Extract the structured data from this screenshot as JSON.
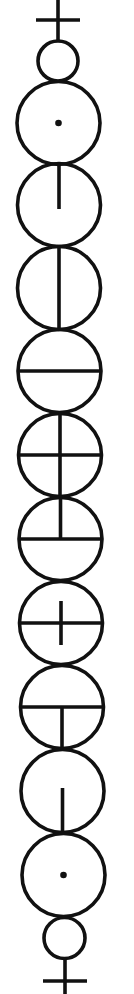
{
  "diagram": {
    "title": "",
    "type": "stacked-circle-symbol-sequence",
    "width": 134,
    "height": 994,
    "colors": {
      "ink": "#111111",
      "background": "#ffffff"
    },
    "stroke_width": 3.6,
    "top_terminal": {
      "cross": {
        "x": 58,
        "y_top": 0,
        "y_bottom": 41,
        "bar_y": 20,
        "bar_x1": 36,
        "bar_x2": 80
      },
      "small_circle": {
        "cx": 58,
        "cy": 61,
        "r": 20
      }
    },
    "circles": [
      {
        "index": 1,
        "cx": 58.5,
        "cy": 123,
        "r": 41.5,
        "mark": "center-dot"
      },
      {
        "index": 2,
        "cx": 59,
        "cy": 205,
        "r": 41.5,
        "mark": "vertical-top-to-center"
      },
      {
        "index": 3,
        "cx": 59,
        "cy": 288,
        "r": 41.5,
        "mark": "vertical-diameter"
      },
      {
        "index": 4,
        "cx": 59.5,
        "cy": 371,
        "r": 41.5,
        "mark": "horizontal-diameter"
      },
      {
        "index": 5,
        "cx": 60,
        "cy": 455,
        "r": 41.5,
        "mark": "full-cross"
      },
      {
        "index": 6,
        "cx": 60.5,
        "cy": 539,
        "r": 41.5,
        "mark": "horizontal-diameter-plus-vertical-top-half"
      },
      {
        "index": 7,
        "cx": 61,
        "cy": 623,
        "r": 41.5,
        "mark": "horizontal-diameter-plus-short-vertical"
      },
      {
        "index": 8,
        "cx": 62,
        "cy": 707,
        "r": 41.5,
        "mark": "horizontal-diameter-plus-vertical-bottom-half"
      },
      {
        "index": 9,
        "cx": 62.5,
        "cy": 791,
        "r": 41.5,
        "mark": "vertical-center-to-bottom"
      },
      {
        "index": 10,
        "cx": 63.5,
        "cy": 875,
        "r": 41.5,
        "mark": "center-dot"
      }
    ],
    "bottom_terminal": {
      "small_circle": {
        "cx": 64.5,
        "cy": 938,
        "r": 20.5
      },
      "cross": {
        "x": 65,
        "y_top": 959,
        "y_bottom": 994,
        "bar_y": 981,
        "bar_x1": 43,
        "bar_x2": 87
      }
    }
  }
}
